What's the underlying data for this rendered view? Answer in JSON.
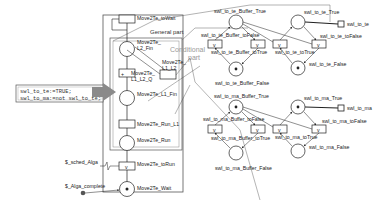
{
  "diagram": {
    "type": "petri-net",
    "code_box": {
      "lines": [
        "swl_to_te:=TRUE;",
        "swl_to_ma:=not swl_to_te;"
      ]
    },
    "regions": {
      "general_part": "General part",
      "conditional_part_line1": "Conditional",
      "conditional_part_line2": "part"
    },
    "main_chain": {
      "toWait": "Move2Te_toWait",
      "L2_Fin_1": "Move2Te_",
      "L2_Fin_2": "L2_Fin",
      "L1_L2_Q_1": "Move2Te_",
      "L1_L2_Q_2": "L1_L2_Q",
      "L1_L2_1": "Move2Te_",
      "L1_L2_2": "L1_L2",
      "L1_Fin": "Move2Te_L1_Fin",
      "Run_L1": "Move2Te_Run_L1",
      "Run": "Move2Te_Run",
      "toRun": "Move2Te_toRun",
      "Wait": "Move2Te_Wait"
    },
    "inputs": {
      "sched": "$_sched_Alga",
      "complete": "$_Alga_complete"
    },
    "te_net": {
      "buffer_true": "swl_to_te_Buffer_True",
      "buffer_false": "swl_to_te_Buffer_False",
      "buffer_to_false": "swl_to_te_Buffer_toFalse",
      "buffer_to_true": "swl_to_te_Buffer_toTrue",
      "true": "swl_to_te_True",
      "false": "swl_to_te_False",
      "to_false": "swl_to_te_toFalse",
      "to_true": "swl_to_te_toTrue",
      "output": "swl_to_te"
    },
    "ma_net": {
      "buffer_true": "swl_to_ma_Buffer_True",
      "buffer_false": "swl_to_ma_Buffer_False",
      "buffer_to_false": "swl_to_ma_Buffer_toFalse",
      "buffer_to_true": "swl_to_ma_Buffer_toTrue",
      "true": "swl_to_ma_True",
      "false": "swl_to_ma_False",
      "to_false": "swl_to_ma_toFalse",
      "to_true": "swl_to_ma_toTrue",
      "output": "swl_to_ma"
    },
    "transition_glyph": "v",
    "token_glyph": "•",
    "colors": {
      "line": "#333333",
      "frame": "#555555",
      "arrow_fill": "#8a8a8a",
      "conditional_text": "#999999"
    }
  }
}
